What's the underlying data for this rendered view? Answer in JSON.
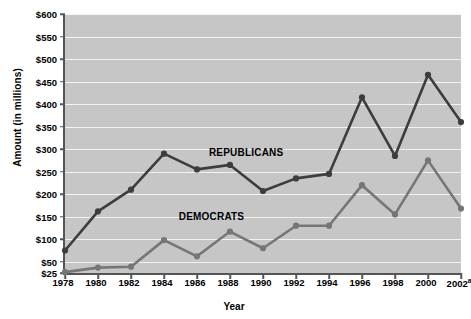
{
  "chart_data": {
    "type": "line",
    "title": "",
    "xlabel": "Year",
    "ylabel": "Amount (in millions)",
    "x": [
      1978,
      1980,
      1982,
      1984,
      1986,
      1988,
      1990,
      1992,
      1994,
      1996,
      1998,
      2000,
      2002
    ],
    "xtick_labels": [
      "1978",
      "1980",
      "1982",
      "1984",
      "1986",
      "1988",
      "1990",
      "1992",
      "1994",
      "1996",
      "1998",
      "2000",
      "2002"
    ],
    "xtick_footnote_index": 12,
    "xtick_footnote_marker": "a",
    "ytick_labels": [
      "$25",
      "$50",
      "$100",
      "$150",
      "$200",
      "$250",
      "$300",
      "$350",
      "$400",
      "$450",
      "$500",
      "$550",
      "$600"
    ],
    "ytick_values": [
      25,
      50,
      100,
      150,
      200,
      250,
      300,
      350,
      400,
      450,
      500,
      550,
      600
    ],
    "ylim": [
      25,
      600
    ],
    "grid": true,
    "legend_position": "inline-annotation",
    "series": [
      {
        "name": "REPUBLICANS",
        "color": "#3d3d3d",
        "label_x": 1989.1,
        "label_y": 293,
        "values": [
          75,
          162,
          210,
          290,
          255,
          265,
          207,
          235,
          245,
          415,
          285,
          465,
          360
        ]
      },
      {
        "name": "DEMOCRATS",
        "color": "#767676",
        "label_x": 1987.0,
        "label_y": 152,
        "values": [
          27,
          37,
          39,
          98,
          62,
          117,
          80,
          130,
          130,
          220,
          155,
          275,
          168
        ]
      }
    ]
  },
  "colors": {
    "plot_background": "#c6c6c6",
    "gridline": "#f2f2f2",
    "axis": "#555555",
    "republicans": "#3d3d3d",
    "democrats": "#767676"
  }
}
